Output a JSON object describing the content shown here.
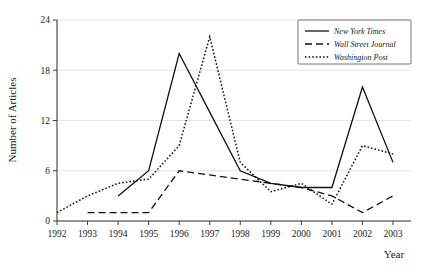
{
  "chart_data": {
    "type": "line",
    "title": "",
    "xlabel": "Year",
    "ylabel": "Number of Articles",
    "categories": [
      "1992",
      "1993",
      "1994",
      "1995",
      "1996",
      "1997",
      "1998",
      "1999",
      "2000",
      "2001",
      "2002",
      "2003"
    ],
    "x": [
      1992,
      1993,
      1994,
      1995,
      1996,
      1997,
      1998,
      1999,
      2000,
      2001,
      2002,
      2003
    ],
    "xlim": [
      1992,
      2003
    ],
    "ylim": [
      0,
      24
    ],
    "yticks": [
      0,
      6,
      12,
      18,
      24
    ],
    "ytick_labels": [
      "0",
      "6",
      "12",
      "18",
      "24"
    ],
    "xticks": [
      1992,
      1993,
      1994,
      1995,
      1996,
      1997,
      1998,
      1999,
      2000,
      2001,
      2002,
      2003
    ],
    "grid": "horizontal",
    "legend_position": "top-right",
    "series": [
      {
        "name": "New York Times",
        "style": "solid",
        "x": [
          1994,
          1995,
          1996,
          1997,
          1998,
          1999,
          2000,
          2001,
          2002,
          2003
        ],
        "values": [
          3,
          6,
          20,
          13,
          6,
          4.5,
          4,
          4,
          16,
          7
        ]
      },
      {
        "name": "Wall Street Journal",
        "style": "dashed",
        "x": [
          1993,
          1994,
          1995,
          1996,
          1997,
          1998,
          1999,
          2000,
          2001,
          2002,
          2003
        ],
        "values": [
          1,
          1,
          1,
          6,
          5.5,
          5,
          4.5,
          4,
          3,
          1,
          3
        ]
      },
      {
        "name": "Washington Post",
        "style": "dotted",
        "x": [
          1992,
          1993,
          1994,
          1995,
          1996,
          1997,
          1998,
          1999,
          2000,
          2001,
          2002,
          2003
        ],
        "values": [
          1,
          3,
          4.5,
          5,
          9,
          22,
          7,
          3.5,
          4.5,
          2,
          9,
          8
        ]
      }
    ]
  },
  "legend": {
    "items": [
      {
        "label": "New York Times",
        "style": "solid"
      },
      {
        "label": "Wall Street Journal",
        "style": "dashed"
      },
      {
        "label": "Washington Post",
        "style": "dotted"
      }
    ]
  },
  "axes": {
    "y_title": "Number of Articles",
    "x_title": "Year"
  }
}
